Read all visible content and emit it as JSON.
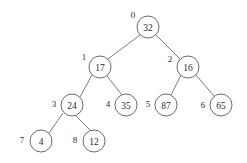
{
  "figure": {
    "background_color": "#ffffff",
    "line_color": "#6b6b6b",
    "text_color": "#2b2b2b"
  },
  "chart_data": {
    "type": "diagram",
    "subtype": "binary-tree",
    "title": "",
    "node_count": 9,
    "nodes": [
      {
        "index": "0",
        "value": "32",
        "cx": 148,
        "cy": 27,
        "r": 11,
        "index_x": 133,
        "index_y": 15,
        "parent": null,
        "side": "root"
      },
      {
        "index": "1",
        "value": "17",
        "cx": 100,
        "cy": 67,
        "r": 11,
        "index_x": 84,
        "index_y": 57,
        "parent": "0",
        "side": "left"
      },
      {
        "index": "2",
        "value": "16",
        "cx": 188,
        "cy": 67,
        "r": 11,
        "index_x": 170,
        "index_y": 59,
        "parent": "0",
        "side": "right"
      },
      {
        "index": "3",
        "value": "24",
        "cx": 72,
        "cy": 105,
        "r": 11,
        "index_x": 54,
        "index_y": 104,
        "parent": "1",
        "side": "left"
      },
      {
        "index": "4",
        "value": "35",
        "cx": 126,
        "cy": 105,
        "r": 11,
        "index_x": 108,
        "index_y": 104,
        "parent": "1",
        "side": "right"
      },
      {
        "index": "5",
        "value": "87",
        "cx": 166,
        "cy": 105,
        "r": 11,
        "index_x": 148,
        "index_y": 104,
        "parent": "2",
        "side": "left"
      },
      {
        "index": "6",
        "value": "65",
        "cx": 221,
        "cy": 105,
        "r": 11,
        "index_x": 203,
        "index_y": 105,
        "parent": "2",
        "side": "right"
      },
      {
        "index": "7",
        "value": "4",
        "cx": 41,
        "cy": 141,
        "r": 11,
        "index_x": 22,
        "index_y": 140,
        "parent": "3",
        "side": "left"
      },
      {
        "index": "8",
        "value": "12",
        "cx": 94,
        "cy": 141,
        "r": 11,
        "index_x": 75,
        "index_y": 140,
        "parent": "3",
        "side": "right"
      }
    ],
    "edges": [
      {
        "from": "0",
        "to": "1",
        "x1": 140,
        "y1": 35,
        "x2": 108,
        "y2": 59
      },
      {
        "from": "0",
        "to": "2",
        "x1": 156,
        "y1": 35,
        "x2": 180,
        "y2": 59
      },
      {
        "from": "1",
        "to": "3",
        "x1": 92,
        "y1": 75,
        "x2": 80,
        "y2": 97
      },
      {
        "from": "1",
        "to": "4",
        "x1": 107,
        "y1": 76,
        "x2": 122,
        "y2": 95
      },
      {
        "from": "2",
        "to": "5",
        "x1": 181,
        "y1": 75,
        "x2": 171,
        "y2": 95
      },
      {
        "from": "2",
        "to": "6",
        "x1": 196,
        "y1": 75,
        "x2": 214,
        "y2": 96
      },
      {
        "from": "3",
        "to": "7",
        "x1": 63,
        "y1": 113,
        "x2": 49,
        "y2": 133
      },
      {
        "from": "3",
        "to": "8",
        "x1": 76,
        "y1": 116,
        "x2": 91,
        "y2": 131
      }
    ],
    "values_in_order": [
      "32",
      "17",
      "16",
      "24",
      "35",
      "87",
      "65",
      "4",
      "12"
    ],
    "indices_in_order": [
      "0",
      "1",
      "2",
      "3",
      "4",
      "5",
      "6",
      "7",
      "8"
    ]
  }
}
